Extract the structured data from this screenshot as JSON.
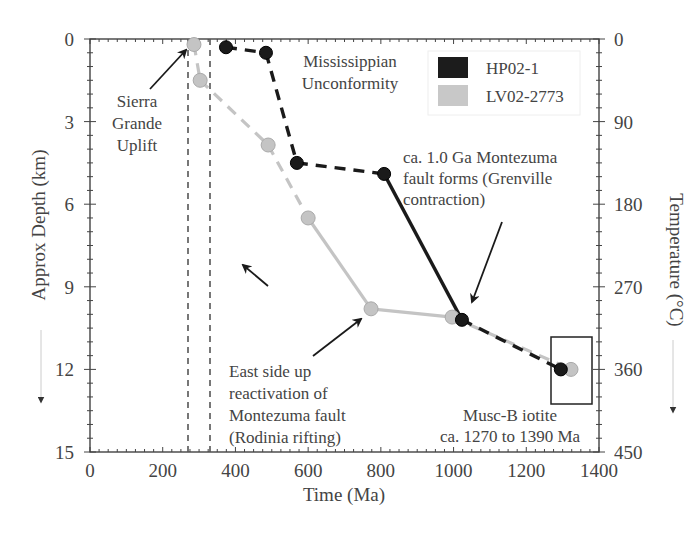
{
  "chart_data": {
    "type": "line",
    "title": "",
    "xlabel": "Time (Ma)",
    "ylabel": "Approx Depth (km)",
    "y2label": "Temperature (°C)",
    "xlim": [
      0,
      1400
    ],
    "ylim": [
      15,
      0
    ],
    "y2lim": [
      450,
      0
    ],
    "x_ticks": [
      "0",
      "200",
      "400",
      "600",
      "800",
      "1000",
      "1200",
      "1400"
    ],
    "y_ticks": [
      "0",
      "3",
      "6",
      "9",
      "12",
      "15"
    ],
    "y2_ticks": [
      "0",
      "90",
      "180",
      "270",
      "360",
      "450"
    ],
    "grid": false,
    "legend_position": "top-right",
    "series": [
      {
        "name": "HP02-1",
        "color": "#1a1a1a",
        "x": [
          374,
          484,
          569,
          809,
          1023,
          1295
        ],
        "y": [
          0.3,
          0.5,
          4.5,
          4.9,
          10.2,
          12.0
        ],
        "segment_styles": [
          "dashed",
          "dashed",
          "dashed",
          "solid",
          "dashed"
        ]
      },
      {
        "name": "LV02-2773",
        "color": "#c4c4c4",
        "x": [
          286,
          303,
          490,
          600,
          773,
          996,
          1323
        ],
        "y": [
          0.2,
          1.5,
          3.85,
          6.5,
          9.8,
          10.1,
          12.0
        ],
        "segment_styles": [
          "dashed",
          "dashed",
          "dashed",
          "solid",
          "solid",
          "dashed"
        ]
      }
    ],
    "reference_lines": [
      {
        "type": "vertical-dashed",
        "x": 270
      },
      {
        "type": "vertical-dashed",
        "x": 330
      }
    ],
    "annotations": [
      {
        "text": [
          "Sierra",
          "Grande",
          "Uplift"
        ]
      },
      {
        "text": [
          "Mississippian",
          "Unconformity"
        ]
      },
      {
        "text": [
          "ca. 1.0 Ga Montezuma",
          "fault forms (Grenville",
          "contraction)"
        ]
      },
      {
        "text": [
          "East side up",
          "reactivation of",
          "Montezuma fault",
          "(Rodinia rifting)"
        ]
      },
      {
        "text": [
          "Musc-B iotite",
          "ca. 1270 to 1390 Ma"
        ]
      }
    ]
  }
}
